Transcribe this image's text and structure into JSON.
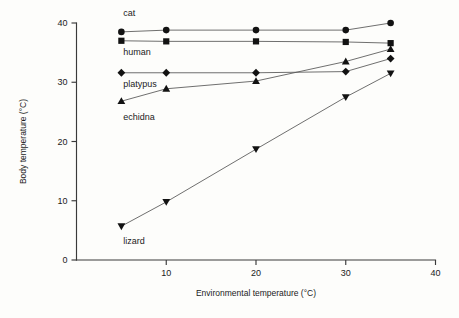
{
  "chart_data": {
    "type": "line",
    "title": "",
    "xlabel": "Environmental temperature (°C)",
    "ylabel": "Body temperature (°C)",
    "xlim": [
      0,
      40
    ],
    "ylim": [
      0,
      40
    ],
    "xticks": [
      0,
      10,
      20,
      30,
      40
    ],
    "xtick_labels": [
      "",
      "10",
      "20",
      "30",
      "40"
    ],
    "yticks": [
      0,
      10,
      20,
      30,
      40
    ],
    "ytick_labels": [
      "0",
      "10",
      "20",
      "30",
      "40"
    ],
    "grid": false,
    "legend_position": "inline-annotations",
    "x": [
      5,
      10,
      20,
      30,
      35
    ],
    "series": [
      {
        "name": "cat",
        "marker": "circle",
        "values": [
          38.5,
          38.8,
          38.8,
          38.8,
          40.0
        ]
      },
      {
        "name": "human",
        "marker": "square",
        "values": [
          37.0,
          36.9,
          36.9,
          36.8,
          36.6
        ]
      },
      {
        "name": "platypus",
        "marker": "diamond",
        "values": [
          31.6,
          31.6,
          31.6,
          31.8,
          34.0
        ]
      },
      {
        "name": "echidna",
        "marker": "triangle-up",
        "values": [
          26.8,
          28.9,
          30.2,
          33.5,
          35.6
        ]
      },
      {
        "name": "lizard",
        "marker": "triangle-down",
        "values": [
          5.7,
          9.8,
          18.7,
          27.5,
          31.5
        ]
      }
    ],
    "annotations": [
      {
        "text": "cat",
        "x": 5.2,
        "y": 41.2,
        "anchor": "start"
      },
      {
        "text": "human",
        "x": 5.2,
        "y": 34.6,
        "anchor": "start"
      },
      {
        "text": "platypus",
        "x": 5.2,
        "y": 29.2,
        "anchor": "start"
      },
      {
        "text": "echidna",
        "x": 5.2,
        "y": 23.6,
        "anchor": "start"
      },
      {
        "text": "lizard",
        "x": 5.2,
        "y": 2.7,
        "anchor": "start"
      }
    ],
    "colors": {
      "marker": "#121212",
      "line": "#555555",
      "axis": "#3a3a3a",
      "text": "#1b1b1b",
      "background": "#fdfdfb"
    }
  }
}
